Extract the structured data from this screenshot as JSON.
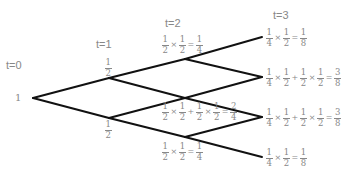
{
  "time_labels": [
    "t=0",
    "t=1",
    "t=2",
    "t=3"
  ],
  "root_value": "1",
  "colors": {
    "edge": "#111111",
    "text": "#888888",
    "background": "#ffffff"
  },
  "nodes": {
    "t0": [
      {
        "id": "root",
        "x": 33,
        "y": 98
      }
    ],
    "t1": [
      {
        "id": "up",
        "x": 109,
        "y": 78
      },
      {
        "id": "down",
        "x": 109,
        "y": 118
      }
    ],
    "t2": [
      {
        "id": "uu",
        "x": 185,
        "y": 59
      },
      {
        "id": "ud",
        "x": 185,
        "y": 98
      },
      {
        "id": "dd",
        "x": 185,
        "y": 137
      }
    ],
    "t3": [
      {
        "id": "uuu",
        "x": 262,
        "y": 37
      },
      {
        "id": "uud",
        "x": 262,
        "y": 77
      },
      {
        "id": "udd",
        "x": 262,
        "y": 117
      },
      {
        "id": "ddd",
        "x": 262,
        "y": 157
      }
    ]
  },
  "t1_labels": {
    "up": {
      "num": "1",
      "den": "2"
    },
    "down": {
      "num": "1",
      "den": "2"
    }
  },
  "t2_labels": {
    "uu": {
      "terms": [
        [
          [
            "1",
            "2"
          ],
          [
            "1",
            "2"
          ]
        ]
      ],
      "result": [
        "1",
        "4"
      ],
      "text": "1/2 × 1/2 = 1/4"
    },
    "ud": {
      "terms": [
        [
          [
            "1",
            "2"
          ],
          [
            "1",
            "2"
          ]
        ],
        [
          [
            "1",
            "2"
          ],
          [
            "1",
            "2"
          ]
        ]
      ],
      "result": [
        "2",
        "4"
      ],
      "text": "1/2 × 1/2 + 1/2 × 1/2 = 2/4"
    },
    "dd": {
      "terms": [
        [
          [
            "1",
            "2"
          ],
          [
            "1",
            "2"
          ]
        ]
      ],
      "result": [
        "1",
        "4"
      ],
      "text": "1/2 × 1/2 = 1/4"
    }
  },
  "t3_labels": {
    "uuu": {
      "terms": [
        [
          [
            "1",
            "4"
          ],
          [
            "1",
            "2"
          ]
        ]
      ],
      "result": [
        "1",
        "8"
      ],
      "text": "1/4 × 1/2 = 1/8"
    },
    "uud": {
      "terms": [
        [
          [
            "1",
            "4"
          ],
          [
            "1",
            "2"
          ]
        ],
        [
          [
            "1",
            "2"
          ],
          [
            "1",
            "2"
          ]
        ]
      ],
      "result": [
        "3",
        "8"
      ],
      "text": "1/4 × 1/2 + 1/2 × 1/2 = 3/8"
    },
    "udd": {
      "terms": [
        [
          [
            "1",
            "4"
          ],
          [
            "1",
            "2"
          ]
        ],
        [
          [
            "1",
            "2"
          ],
          [
            "1",
            "2"
          ]
        ]
      ],
      "result": [
        "3",
        "8"
      ],
      "text": "1/4 × 1/2 + 1/2 × 1/2 = 3/8"
    },
    "ddd": {
      "terms": [
        [
          [
            "1",
            "4"
          ],
          [
            "1",
            "2"
          ]
        ]
      ],
      "result": [
        "1",
        "8"
      ],
      "text": "1/4 × 1/2 = 1/8"
    }
  },
  "symbols": {
    "times": "×",
    "plus": "+",
    "equals": "="
  }
}
